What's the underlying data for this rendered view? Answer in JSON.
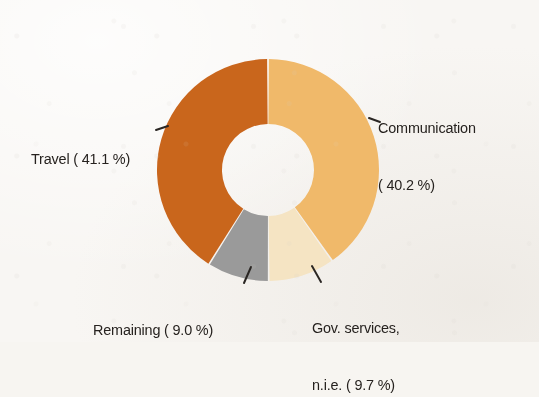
{
  "figure": {
    "background_color": "#f8f6f3",
    "text_color": "#26221f"
  },
  "chart_data": {
    "type": "pie",
    "variant": "donut",
    "title": "",
    "subtitle": "",
    "xlabel": "",
    "ylabel": "",
    "legend_position": "none",
    "grid": false,
    "start_angle_deg": 0,
    "direction": "clockwise",
    "inner_radius_ratio": 0.42,
    "center": {
      "x": 268,
      "y": 170
    },
    "outer_radius": 111,
    "inner_radius": 46,
    "categories": [
      "Communication",
      "Gov. services, n.i.e.",
      "Remaining",
      "Travel"
    ],
    "values": [
      40.2,
      9.7,
      9.0,
      41.1
    ],
    "unit": "%",
    "slices": [
      {
        "name": "Communication",
        "value": 40.2,
        "color": "#f0b96b",
        "label_lines": [
          "Communication",
          "( 40.2 %)"
        ],
        "leader": "dash-left"
      },
      {
        "name": "Gov. services, n.i.e.",
        "value": 9.7,
        "color": "#f5e4c3",
        "label_lines": [
          "Gov. services,",
          "n.i.e. ( 9.7 %)"
        ],
        "leader": "tick-up-left"
      },
      {
        "name": "Remaining",
        "value": 9.0,
        "color": "#9a9a9a",
        "label_lines": [
          "Remaining ( 9.0 %)"
        ],
        "leader": "tick-up-right"
      },
      {
        "name": "Travel",
        "value": 41.1,
        "color": "#c9661f",
        "label_lines": [
          "Travel ( 41.1 %)"
        ],
        "leader": "dash-right"
      }
    ]
  },
  "labels": {
    "communication": {
      "line1": "Communication",
      "line2": "( 40.2 %)"
    },
    "travel": {
      "line1": "Travel ( 41.1 %)"
    },
    "remaining": {
      "line1": "Remaining ( 9.0 %)"
    },
    "gov_services": {
      "line1": "Gov. services,",
      "line2": "n.i.e. ( 9.7 %)"
    }
  }
}
